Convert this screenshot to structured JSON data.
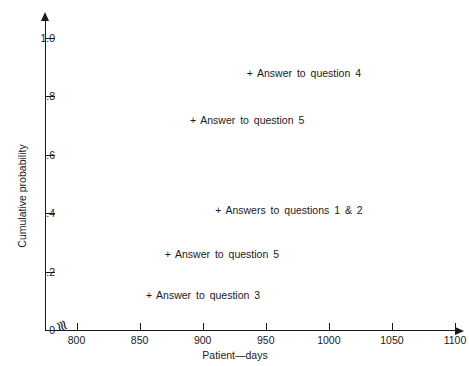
{
  "chart_data": {
    "type": "scatter",
    "title": "",
    "xlabel": "Patient—days",
    "ylabel": "Cumulative probability",
    "xlim": [
      775,
      1100
    ],
    "ylim": [
      0,
      1.0
    ],
    "grid": false,
    "legend": "none",
    "x_axis_break": true,
    "x_ticks": [
      800,
      850,
      900,
      950,
      1000,
      1050,
      1100
    ],
    "x_tick_labels": [
      "800",
      "850",
      "900",
      "950",
      "1000",
      "1050",
      "1100"
    ],
    "y_ticks": [
      0,
      0.2,
      0.4,
      0.6,
      0.8,
      1.0
    ],
    "y_tick_labels": [
      "0",
      ".2",
      ".4",
      ".6",
      ".8",
      "1.0"
    ],
    "marker": "+",
    "points": [
      {
        "label": "Answer to question 4",
        "x": 935,
        "y": 0.88
      },
      {
        "label": "Answer to question 5",
        "x": 890,
        "y": 0.72
      },
      {
        "label": "Answers to questions 1 & 2",
        "x": 910,
        "y": 0.41
      },
      {
        "label": "Answer to question 5",
        "x": 870,
        "y": 0.26
      },
      {
        "label": "Answer to question 3",
        "x": 855,
        "y": 0.12
      }
    ]
  },
  "axis_break_glyph": "≋",
  "marker_glyph": "+"
}
